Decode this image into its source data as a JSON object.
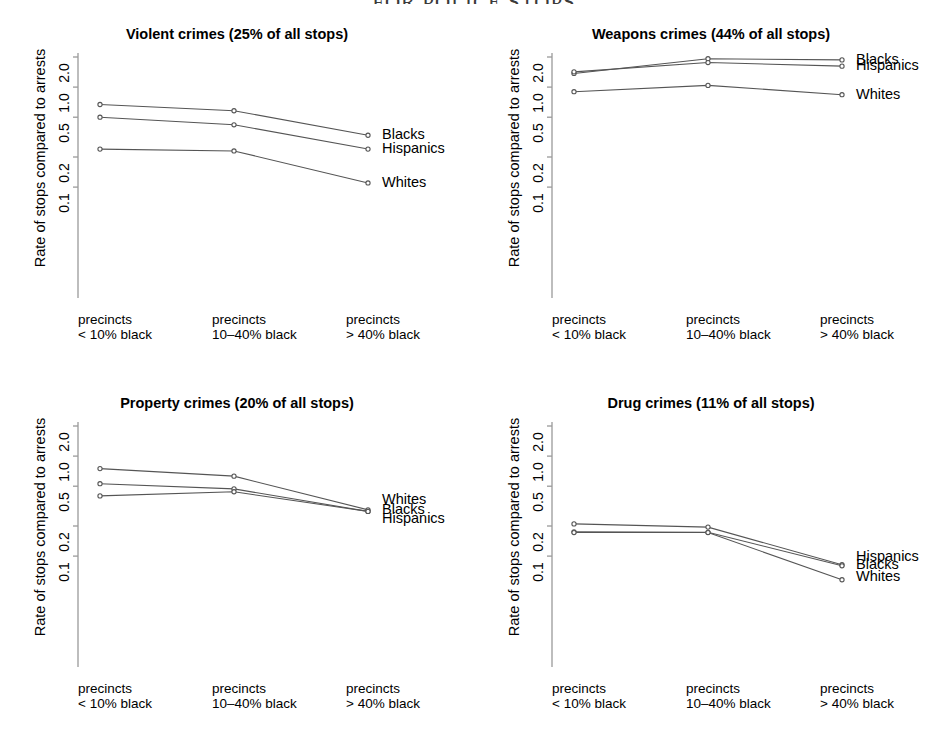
{
  "page": {
    "title": "FOR POLICE STOPS"
  },
  "common": {
    "ylabel": "Rate of stops compared to arrests",
    "ytick_labels": [
      "2.0",
      "1.0",
      "0.5",
      "0.2",
      "0.1"
    ],
    "ytick_values": [
      2.0,
      1.0,
      0.5,
      0.2,
      0.1
    ],
    "xtick_labels": [
      [
        "precincts",
        "< 10% black"
      ],
      [
        "precincts",
        "10–40% black"
      ],
      [
        "precincts",
        "> 40% black"
      ]
    ],
    "series_names": [
      "Blacks",
      "Hispanics",
      "Whites"
    ],
    "line_color": "#555555",
    "point_color": "#555555",
    "axis_color": "#9a9a9a"
  },
  "chart_data": [
    {
      "type": "line",
      "panel": "violent",
      "title": "Violent crimes (25% of all stops)",
      "xlabel": "",
      "ylabel": "Rate of stops compared to arrests",
      "categories": [
        "precincts < 10% black",
        "precincts 10–40% black",
        "precincts > 40% black"
      ],
      "yscale": "log",
      "ylim": [
        0.06,
        2.6
      ],
      "yticks": [
        2.0,
        1.0,
        0.5,
        0.2,
        0.1
      ],
      "grid": false,
      "legend": "right-endpoint-labels",
      "series": [
        {
          "name": "Blacks",
          "values": [
            0.67,
            0.58,
            0.33
          ]
        },
        {
          "name": "Hispanics",
          "values": [
            0.5,
            0.42,
            0.24
          ]
        },
        {
          "name": "Whites",
          "values": [
            0.24,
            0.23,
            0.11
          ]
        }
      ]
    },
    {
      "type": "line",
      "panel": "weapons",
      "title": "Weapons crimes (44% of all stops)",
      "xlabel": "",
      "ylabel": "Rate of stops compared to arrests",
      "categories": [
        "precincts < 10% black",
        "precincts 10–40% black",
        "precincts > 40% black"
      ],
      "yscale": "log",
      "ylim": [
        0.06,
        2.6
      ],
      "yticks": [
        2.0,
        1.0,
        0.5,
        0.2,
        0.1
      ],
      "grid": false,
      "legend": "right-endpoint-labels",
      "series": [
        {
          "name": "Blacks",
          "values": [
            1.37,
            1.92,
            1.87
          ]
        },
        {
          "name": "Hispanics",
          "values": [
            1.42,
            1.76,
            1.62
          ]
        },
        {
          "name": "Whites",
          "values": [
            0.9,
            1.04,
            0.84
          ]
        }
      ]
    },
    {
      "type": "line",
      "panel": "property",
      "title": "Property crimes (20% of all stops)",
      "xlabel": "",
      "ylabel": "Rate of stops compared to arrests",
      "categories": [
        "precincts < 10% black",
        "precincts 10–40% black",
        "precincts > 40% black"
      ],
      "yscale": "log",
      "ylim": [
        0.06,
        2.6
      ],
      "yticks": [
        2.0,
        1.0,
        0.5,
        0.2,
        0.1
      ],
      "grid": false,
      "legend": "right-endpoint-labels",
      "series": [
        {
          "name": "Whites",
          "values": [
            0.75,
            0.63,
            0.29
          ]
        },
        {
          "name": "Blacks",
          "values": [
            0.53,
            0.47,
            0.28
          ]
        },
        {
          "name": "Hispanics",
          "values": [
            0.4,
            0.44,
            0.28
          ]
        }
      ]
    },
    {
      "type": "line",
      "panel": "drug",
      "title": "Drug crimes (11% of all stops)",
      "xlabel": "",
      "ylabel": "Rate of stops compared to arrests",
      "categories": [
        "precincts < 10% black",
        "precincts 10–40% black",
        "precincts > 40% black"
      ],
      "yscale": "log",
      "ylim": [
        0.035,
        2.6
      ],
      "yticks": [
        2.0,
        1.0,
        0.5,
        0.2,
        0.1
      ],
      "grid": false,
      "legend": "right-endpoint-labels",
      "series": [
        {
          "name": "Hispanics",
          "values": [
            0.21,
            0.195,
            0.082
          ]
        },
        {
          "name": "Blacks",
          "values": [
            0.175,
            0.173,
            0.08
          ]
        },
        {
          "name": "Whites",
          "values": [
            0.172,
            0.172,
            0.058
          ]
        }
      ]
    }
  ],
  "panels": [
    {
      "id": "violent",
      "title": "Violent crimes (25% of all stops)",
      "labels": [
        {
          "name": "Blacks",
          "y": 0.33
        },
        {
          "name": "Hispanics",
          "y": 0.24
        },
        {
          "name": "Whites",
          "y": 0.11
        }
      ]
    },
    {
      "id": "weapons",
      "title": "Weapons crimes (44% of all stops)",
      "labels": [
        {
          "name": "Blacks",
          "y": 1.87
        },
        {
          "name": "Hispanics",
          "y": 1.62
        },
        {
          "name": "Whites",
          "y": 0.84
        }
      ]
    },
    {
      "id": "property",
      "title": "Property crimes (20% of all stops)",
      "labels": [
        {
          "name": "Whites",
          "y": 0.36
        },
        {
          "name": "Blacks",
          "y": 0.29
        },
        {
          "name": "Hispanics",
          "y": 0.235
        }
      ]
    },
    {
      "id": "drug",
      "title": "Drug crimes (11% of all stops)",
      "labels": [
        {
          "name": "Hispanics",
          "y": 0.098
        },
        {
          "name": "Blacks",
          "y": 0.082
        },
        {
          "name": "Whites",
          "y": 0.062
        }
      ]
    }
  ]
}
